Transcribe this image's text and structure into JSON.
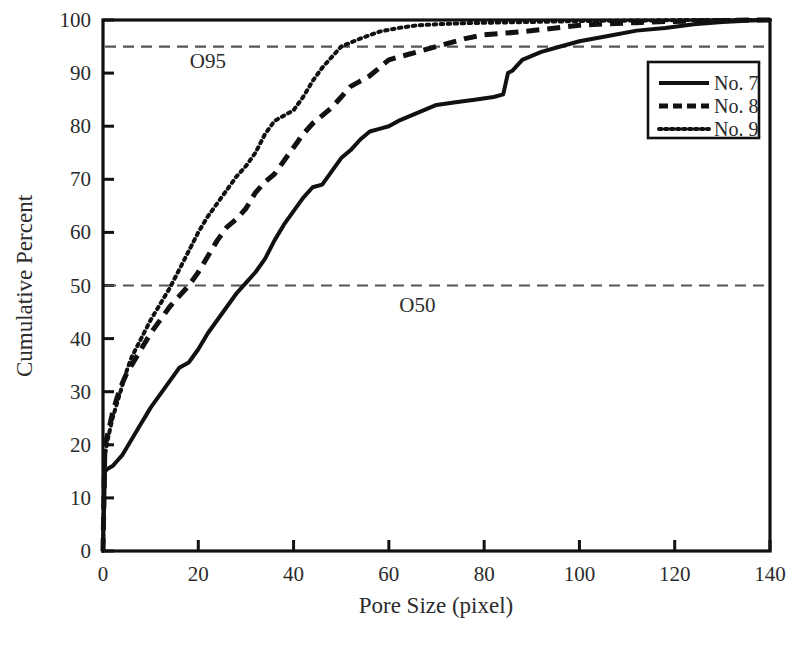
{
  "chart_data": {
    "type": "line",
    "title": "",
    "xlabel": "Pore Size (pixel)",
    "ylabel": "Cumulative Percent",
    "xlim": [
      0,
      140
    ],
    "ylim": [
      0,
      100
    ],
    "xticks": [
      0,
      20,
      40,
      60,
      80,
      100,
      120,
      140
    ],
    "yticks": [
      0,
      10,
      20,
      30,
      40,
      50,
      60,
      70,
      80,
      90,
      100
    ],
    "grid": false,
    "legend_position": "upper right",
    "annotations": [
      {
        "text": "O95",
        "x": 22,
        "y": 91,
        "note": "label for 95 percent reference line"
      },
      {
        "text": "O50",
        "x": 66,
        "y": 45,
        "note": "label for 50 percent reference line"
      }
    ],
    "reference_lines": [
      {
        "name": "O95",
        "y": 95,
        "style": "dashed"
      },
      {
        "name": "O50",
        "y": 50,
        "style": "dashed"
      }
    ],
    "series": [
      {
        "name": "No. 7",
        "style": "solid",
        "color": "#111111",
        "x": [
          0,
          0.4,
          1,
          2,
          3,
          4,
          5,
          6,
          7,
          8,
          9,
          10,
          12,
          14,
          16,
          18,
          20,
          22,
          24,
          26,
          28,
          30,
          32,
          34,
          36,
          38,
          40,
          42,
          44,
          46,
          48,
          50,
          52,
          54,
          56,
          58,
          60,
          62,
          66,
          70,
          74,
          78,
          82,
          84,
          85,
          86,
          88,
          92,
          96,
          100,
          106,
          112,
          118,
          124,
          130,
          136,
          140
        ],
        "y": [
          0,
          15,
          15.5,
          16,
          17,
          18,
          19.5,
          21,
          22.5,
          24,
          25.5,
          27,
          29.5,
          32,
          34.5,
          35.5,
          38,
          41,
          43.5,
          46,
          48.5,
          50.5,
          52.5,
          55,
          58.5,
          61.5,
          64,
          66.5,
          68.5,
          69,
          71.5,
          74,
          75.5,
          77.5,
          79,
          79.5,
          80,
          81,
          82.5,
          84,
          84.5,
          85,
          85.5,
          86,
          90,
          90.5,
          92.5,
          94,
          95,
          96,
          97,
          98,
          98.5,
          99.2,
          99.6,
          99.9,
          100
        ]
      },
      {
        "name": "No. 8",
        "style": "dashed",
        "color": "#111111",
        "x": [
          0,
          0.4,
          1,
          2,
          3,
          4,
          5,
          6,
          8,
          10,
          12,
          14,
          16,
          18,
          20,
          22,
          24,
          26,
          28,
          30,
          32,
          34,
          36,
          38,
          40,
          42,
          44,
          46,
          48,
          50,
          52,
          54,
          56,
          58,
          60,
          64,
          68,
          72,
          76,
          80,
          84,
          88,
          92,
          96,
          100,
          106,
          112,
          118,
          124,
          130,
          136,
          140
        ],
        "y": [
          0,
          20,
          22,
          26,
          29,
          31.5,
          33.5,
          35,
          38,
          41,
          43.5,
          46,
          48,
          50,
          52.5,
          55.5,
          58.5,
          61,
          62.5,
          64.5,
          67.5,
          69.5,
          71,
          73.5,
          76,
          78.5,
          80.5,
          82,
          83.5,
          85.5,
          87.5,
          88.5,
          89.5,
          91,
          92.5,
          93.5,
          94.5,
          95.5,
          96.5,
          97.2,
          97.5,
          97.8,
          98.2,
          98.6,
          99,
          99.3,
          99.5,
          99.7,
          99.8,
          99.9,
          100,
          100
        ]
      },
      {
        "name": "No. 9",
        "style": "dotted",
        "color": "#111111",
        "x": [
          0,
          0.4,
          1,
          2,
          3,
          4,
          5,
          6,
          8,
          10,
          12,
          14,
          16,
          18,
          20,
          22,
          24,
          26,
          28,
          30,
          32,
          34,
          36,
          38,
          40,
          42,
          44,
          46,
          48,
          50,
          54,
          58,
          62,
          66,
          70,
          76,
          82,
          88,
          94,
          100,
          106,
          112,
          118,
          124,
          130,
          136,
          140
        ],
        "y": [
          0,
          18,
          21,
          25,
          28,
          31,
          34,
          36.5,
          40,
          43.5,
          46.5,
          49.5,
          53,
          56.5,
          60,
          63,
          65.5,
          68,
          70.5,
          72.5,
          75,
          78.5,
          81,
          82,
          83,
          85.5,
          88.5,
          91,
          93,
          95,
          96.5,
          97.8,
          98.5,
          99,
          99.2,
          99.4,
          99.5,
          99.6,
          99.7,
          99.8,
          99.85,
          99.9,
          99.95,
          100,
          100,
          100,
          100
        ]
      }
    ]
  },
  "legend": {
    "entries": [
      {
        "label": "No. 7",
        "style": "solid"
      },
      {
        "label": "No. 8",
        "style": "dashed"
      },
      {
        "label": "No. 9",
        "style": "dotted"
      }
    ]
  },
  "axes": {
    "x_title": "Pore Size (pixel)",
    "y_title": "Cumulative Percent",
    "x_tick_labels": [
      "0",
      "20",
      "40",
      "60",
      "80",
      "100",
      "120",
      "140"
    ],
    "y_tick_labels": [
      "0",
      "10",
      "20",
      "30",
      "40",
      "50",
      "60",
      "70",
      "80",
      "90",
      "100"
    ]
  },
  "colors": {
    "background": "#ffffff",
    "axis": "#111111",
    "text": "#2b2b2b",
    "reference_line": "#555555",
    "series": "#111111"
  }
}
